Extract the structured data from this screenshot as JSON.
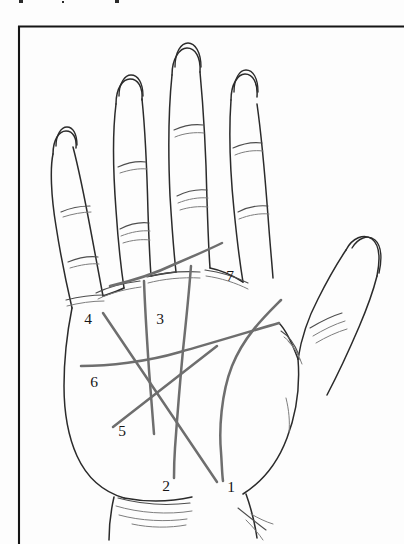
{
  "figure": {
    "alt_description": "Line drawing of an open left palm, fingers up, thumb to the right, with seven numbered palm lines",
    "background_color": "#fdfdfd",
    "outline_color": "#2b2b2b",
    "palm_line_color": "#6e6e6e",
    "frame_color": "#151515"
  },
  "frame": {
    "name": "figure-border",
    "left_x": 18,
    "top_y": 26,
    "right_x": 404,
    "bottom_y": 544,
    "sides_drawn": "top-and-left"
  },
  "labels": [
    {
      "id": "1",
      "text": "1",
      "x": 231,
      "y": 488,
      "line_name": "line-1"
    },
    {
      "id": "2",
      "text": "2",
      "x": 166,
      "y": 487,
      "line_name": "line-2"
    },
    {
      "id": "3",
      "text": "3",
      "x": 160,
      "y": 320,
      "line_name": "line-3"
    },
    {
      "id": "4",
      "text": "4",
      "x": 88,
      "y": 320,
      "line_name": "line-4"
    },
    {
      "id": "5",
      "text": "5",
      "x": 122,
      "y": 432,
      "line_name": "line-5"
    },
    {
      "id": "6",
      "text": "6",
      "x": 94,
      "y": 383,
      "line_name": "line-6"
    },
    {
      "id": "7",
      "text": "7",
      "x": 230,
      "y": 277,
      "line_name": "line-7"
    }
  ],
  "palm_lines": [
    {
      "name": "line-1",
      "number": "1",
      "path": "M 281 300 C 265 316 244 336 232 366 C 221 394 219 430 221 452 C 222 466 222 474 223 481"
    },
    {
      "name": "line-2",
      "number": "2",
      "path": "M 191 266 C 189 292 186 322 183 350 C 180 382 177 420 175 448 C 174 462 174 470 174 478"
    },
    {
      "name": "line-3",
      "number": "3",
      "path": "M 144 281 C 145 310 147 340 149 370 C 151 398 153 420 154 434"
    },
    {
      "name": "line-4",
      "number": "4",
      "path": "M 103 313 L 217 482"
    },
    {
      "name": "line-5",
      "number": "5",
      "path": "M 113 427 L 217 346"
    },
    {
      "name": "line-6",
      "number": "6",
      "path": "M 81 366 C 108 366 146 362 180 352 C 212 343 248 332 279 323"
    },
    {
      "name": "line-7",
      "number": "7",
      "path": "M 110 286 C 132 281 154 274 175 264 C 196 255 212 248 222 243"
    }
  ]
}
